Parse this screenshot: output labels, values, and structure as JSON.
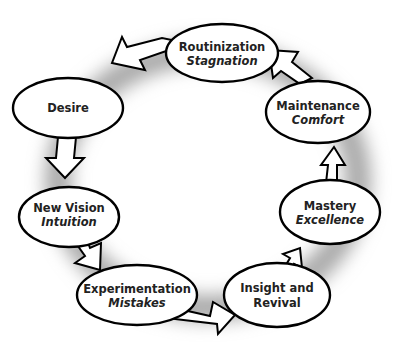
{
  "diagram": {
    "type": "cycle",
    "nodes": [
      {
        "id": "routinization",
        "title": "Routinization",
        "subtitle": "Stagnation"
      },
      {
        "id": "desire",
        "title": "Desire",
        "subtitle": ""
      },
      {
        "id": "new-vision",
        "title": "New Vision",
        "subtitle": "Intuition"
      },
      {
        "id": "experimentation",
        "title": "Experimentation",
        "subtitle": "Mistakes"
      },
      {
        "id": "insight",
        "title": "Insight and",
        "subtitle_plain": "Revival"
      },
      {
        "id": "mastery",
        "title": "Mastery",
        "subtitle": "Excellence"
      },
      {
        "id": "maintenance",
        "title": "Maintenance",
        "subtitle": "Comfort"
      }
    ],
    "edges": [
      {
        "from": "routinization",
        "to": "desire"
      },
      {
        "from": "desire",
        "to": "new-vision"
      },
      {
        "from": "new-vision",
        "to": "experimentation"
      },
      {
        "from": "experimentation",
        "to": "insight"
      },
      {
        "from": "insight",
        "to": "mastery"
      },
      {
        "from": "mastery",
        "to": "maintenance"
      },
      {
        "from": "maintenance",
        "to": "routinization"
      }
    ],
    "colors": {
      "stroke": "#000000",
      "fill": "#ffffff",
      "text": "#222222",
      "ring_shadow": "#9a9a9a"
    }
  }
}
